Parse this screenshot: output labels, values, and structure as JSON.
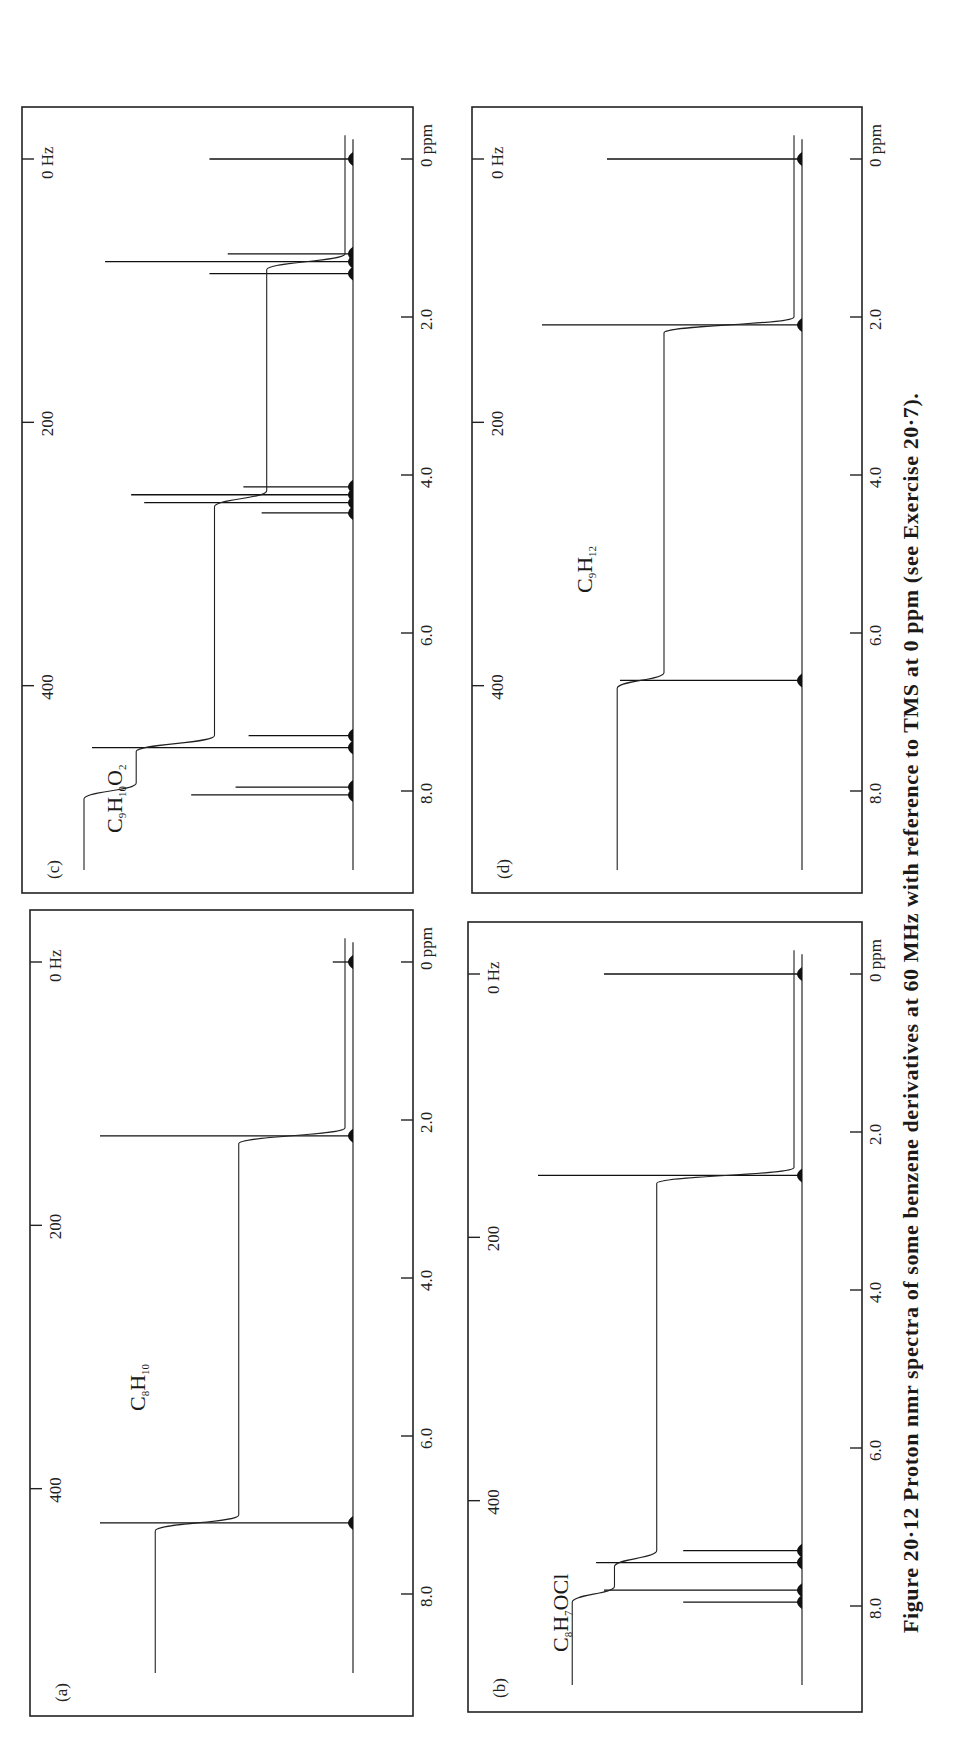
{
  "figure": {
    "caption": "Figure 20·12  Proton nmr spectra of some benzene derivatives at 60 MHz with reference to TMS at 0 ppm (see Exercise 20·7).",
    "orientation": "rotated 90° counter-clockwise on page"
  },
  "chart_data": [
    {
      "type": "line",
      "panel": "(a)",
      "title": "C8H10",
      "formula_parts": [
        "C",
        "8",
        "H",
        "10",
        "",
        ""
      ],
      "xlabel": "ppm",
      "x2label": "Hz",
      "x_ticks_ppm": [
        "0",
        "2.0",
        "4.0",
        "6.0",
        "8.0"
      ],
      "x_ticks_hz": [
        "0 Hz",
        "200",
        "400"
      ],
      "xlim_ppm": [
        9.5,
        -0.6
      ],
      "peaks": [
        {
          "ppm": 0.0,
          "height": 0.08,
          "label": "TMS"
        },
        {
          "ppm": 2.2,
          "height": 1.0
        },
        {
          "ppm": 7.1,
          "height": 1.0
        }
      ],
      "integral_steps": [
        {
          "ppm": 2.2,
          "step": 0.42
        },
        {
          "ppm": 7.1,
          "step": 0.33
        }
      ]
    },
    {
      "type": "line",
      "panel": "(b)",
      "title": "C8H7OCl",
      "formula_parts": [
        "C",
        "8",
        "H",
        "7",
        "OCl",
        ""
      ],
      "xlabel": "ppm",
      "x2label": "Hz",
      "x_ticks_ppm": [
        "0",
        "2.0",
        "4.0",
        "6.0",
        "8.0"
      ],
      "x_ticks_hz": [
        "0 Hz",
        "200",
        "400"
      ],
      "xlim_ppm": [
        9.5,
        -0.6
      ],
      "peaks": [
        {
          "ppm": 0.0,
          "height": 0.75,
          "label": "TMS"
        },
        {
          "ppm": 2.55,
          "height": 1.0
        },
        {
          "ppm": 7.3,
          "height": 0.45
        },
        {
          "ppm": 7.45,
          "height": 0.78
        },
        {
          "ppm": 7.8,
          "height": 0.75
        },
        {
          "ppm": 7.95,
          "height": 0.45
        }
      ],
      "integral_steps": [
        {
          "ppm": 2.55,
          "step": 0.52
        },
        {
          "ppm": 7.4,
          "step": 0.16
        },
        {
          "ppm": 7.85,
          "step": 0.16
        }
      ]
    },
    {
      "type": "line",
      "panel": "(c)",
      "title": "C9H10O2",
      "formula_parts": [
        "C",
        "9",
        "H",
        "10",
        "O",
        "2"
      ],
      "xlabel": "ppm",
      "x2label": "Hz",
      "x_ticks_ppm": [
        "0",
        "2.0",
        "4.0",
        "6.0",
        "8.0"
      ],
      "x_ticks_hz": [
        "0 Hz",
        "200",
        "400"
      ],
      "xlim_ppm": [
        9.5,
        -0.6
      ],
      "peaks": [
        {
          "ppm": 0.0,
          "height": 0.55,
          "label": "TMS"
        },
        {
          "ppm": 1.2,
          "height": 0.48
        },
        {
          "ppm": 1.3,
          "height": 0.95
        },
        {
          "ppm": 1.45,
          "height": 0.55
        },
        {
          "ppm": 4.15,
          "height": 0.42
        },
        {
          "ppm": 4.25,
          "height": 0.85
        },
        {
          "ppm": 4.35,
          "height": 0.8
        },
        {
          "ppm": 4.48,
          "height": 0.35
        },
        {
          "ppm": 7.3,
          "height": 0.4
        },
        {
          "ppm": 7.45,
          "height": 1.0
        },
        {
          "ppm": 7.95,
          "height": 0.45
        },
        {
          "ppm": 8.05,
          "height": 0.62
        }
      ],
      "integral_steps": [
        {
          "ppm": 1.3,
          "step": 0.3
        },
        {
          "ppm": 4.3,
          "step": 0.2
        },
        {
          "ppm": 7.4,
          "step": 0.3
        },
        {
          "ppm": 8.0,
          "step": 0.2
        }
      ]
    },
    {
      "type": "line",
      "panel": "(d)",
      "title": "C9H12",
      "formula_parts": [
        "C",
        "9",
        "H",
        "12",
        "",
        ""
      ],
      "xlabel": "ppm",
      "x2label": "Hz",
      "x_ticks_ppm": [
        "0",
        "2.0",
        "4.0",
        "6.0",
        "8.0"
      ],
      "x_ticks_hz": [
        "0 Hz",
        "200",
        "400"
      ],
      "xlim_ppm": [
        9.5,
        -0.6
      ],
      "peaks": [
        {
          "ppm": 0.0,
          "height": 0.75,
          "label": "TMS"
        },
        {
          "ppm": 2.1,
          "height": 1.0
        },
        {
          "ppm": 6.6,
          "height": 0.7
        }
      ],
      "integral_steps": [
        {
          "ppm": 2.1,
          "step": 0.5
        },
        {
          "ppm": 6.6,
          "step": 0.18
        }
      ]
    }
  ],
  "panels": {
    "a": {
      "letter": "(a)",
      "formula": {
        "c": "C",
        "cn": "8",
        "h": "H",
        "hn": "10",
        "rest": "",
        "restn": ""
      },
      "hz_top": "0 Hz",
      "hz_200": "200",
      "hz_400": "400",
      "ppm": [
        "0 ppm",
        "2.0",
        "4.0",
        "6.0",
        "8.0"
      ]
    },
    "b": {
      "letter": "(b)",
      "formula": {
        "c": "C",
        "cn": "8",
        "h": "H",
        "hn": "7",
        "rest": "OCl",
        "restn": ""
      },
      "hz_top": "0 Hz",
      "hz_200": "200",
      "hz_400": "400",
      "ppm": [
        "0 ppm",
        "2.0",
        "4.0",
        "6.0",
        "8.0"
      ]
    },
    "c": {
      "letter": "(c)",
      "formula": {
        "c": "C",
        "cn": "9",
        "h": "H",
        "hn": "10",
        "rest": "O",
        "restn": "2"
      },
      "hz_top": "0 Hz",
      "hz_200": "200",
      "hz_400": "400",
      "ppm": [
        "0 ppm",
        "2.0",
        "4.0",
        "6.0",
        "8.0"
      ]
    },
    "d": {
      "letter": "(d)",
      "formula": {
        "c": "C",
        "cn": "9",
        "h": "H",
        "hn": "12",
        "rest": "",
        "restn": ""
      },
      "hz_top": "0 Hz",
      "hz_200": "200",
      "hz_400": "400",
      "ppm": [
        "0 ppm",
        "2.0",
        "4.0",
        "6.0",
        "8.0"
      ]
    }
  }
}
